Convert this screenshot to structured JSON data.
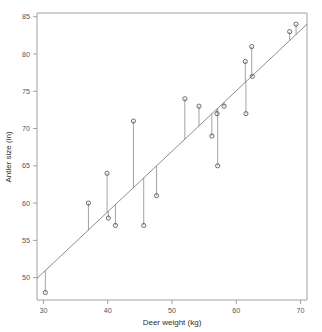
{
  "chart_data": {
    "type": "scatter",
    "title": "",
    "xlabel": "Deer weight (kg)",
    "ylabel": "Antler size (in)",
    "xlim": [
      29,
      71
    ],
    "ylim": [
      47,
      85.5
    ],
    "xticks": [
      30,
      40,
      50,
      60,
      70
    ],
    "yticks": [
      50,
      55,
      60,
      65,
      70,
      75,
      80,
      85
    ],
    "xtick_labels": [
      "30",
      "40",
      "50",
      "60",
      "70"
    ],
    "ytick_labels": [
      "50",
      "55",
      "60",
      "65",
      "70",
      "75",
      "80",
      "85"
    ],
    "grid": false,
    "legend": null,
    "marker": "open-circle",
    "x": [
      30.3,
      37.0,
      39.9,
      40.1,
      41.2,
      44.0,
      45.6,
      47.6,
      52.0,
      54.2,
      56.2,
      57.0,
      57.1,
      58.1,
      61.4,
      61.5,
      62.4,
      62.5,
      68.3,
      69.3
    ],
    "y": [
      48.0,
      60.0,
      64.0,
      58.0,
      57.0,
      71.0,
      57.0,
      61.0,
      74.0,
      73.0,
      69.0,
      72.0,
      65.0,
      73.0,
      79.0,
      72.0,
      81.0,
      77.0,
      83.0,
      84.0
    ],
    "series": [
      {
        "name": "observations",
        "points": [
          {
            "x": 30.3,
            "y": 48.0
          },
          {
            "x": 37.0,
            "y": 60.0
          },
          {
            "x": 39.9,
            "y": 64.0
          },
          {
            "x": 40.1,
            "y": 58.0
          },
          {
            "x": 41.2,
            "y": 57.0
          },
          {
            "x": 44.0,
            "y": 71.0
          },
          {
            "x": 45.6,
            "y": 57.0
          },
          {
            "x": 47.6,
            "y": 61.0
          },
          {
            "x": 52.0,
            "y": 74.0
          },
          {
            "x": 54.2,
            "y": 73.0
          },
          {
            "x": 56.2,
            "y": 69.0
          },
          {
            "x": 57.0,
            "y": 72.0
          },
          {
            "x": 57.1,
            "y": 65.0
          },
          {
            "x": 58.1,
            "y": 73.0
          },
          {
            "x": 61.4,
            "y": 79.0
          },
          {
            "x": 61.5,
            "y": 72.0
          },
          {
            "x": 62.4,
            "y": 81.0
          },
          {
            "x": 62.5,
            "y": 77.0
          },
          {
            "x": 68.3,
            "y": 83.0
          },
          {
            "x": 69.3,
            "y": 84.0
          }
        ]
      }
    ],
    "fit_line": {
      "name": "least-squares regression line",
      "x_start": 29.0,
      "y_start": 49.9,
      "x_end": 71.0,
      "y_end": 84.0
    },
    "residuals_shown": true,
    "colors": {
      "marker_stroke": "#4a4a4a",
      "fit_line": "#6e6e6e",
      "residual_line": "#7a7a7a",
      "axis": "#8a8a8a",
      "text": "#3c3c3c",
      "background": "#ffffff"
    }
  }
}
